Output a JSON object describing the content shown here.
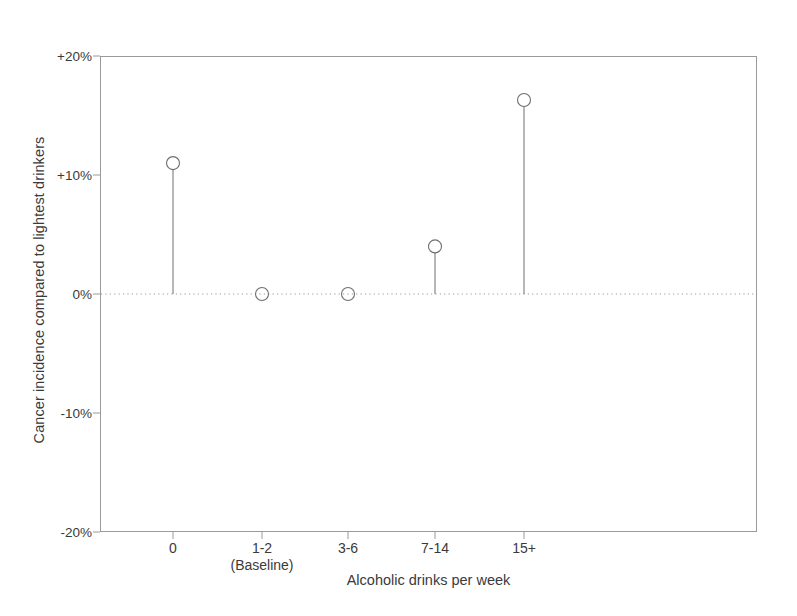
{
  "chart_data": {
    "type": "scatter",
    "title": "",
    "subtitle": "",
    "xlabel": "Alcoholic drinks per week",
    "ylabel": "Cancer incidence compared to lightest drinkers",
    "categories": [
      "0",
      "1-2\n(Baseline)",
      "3-6",
      "7-14",
      "15+"
    ],
    "category_labels": [
      "0",
      "1-2",
      "3-6",
      "7-14",
      "15+"
    ],
    "baseline_note": "(Baseline)",
    "values": [
      11,
      0,
      0,
      4,
      16.3
    ],
    "value_labels": [
      "+11%",
      "0%",
      "0%",
      "+4%",
      "+16.3%"
    ],
    "ylim": [
      -20,
      20
    ],
    "ytick_values": [
      20,
      10,
      0,
      -10,
      -20
    ],
    "ytick_labels": [
      "+20%",
      "+10%",
      "0%",
      "-10%",
      "-20%"
    ],
    "grid": false,
    "legend": "none",
    "reference_line": {
      "value": 0,
      "style": "dotted",
      "color": "#9a9a9a"
    },
    "marker": {
      "shape": "circle",
      "filled": false,
      "edge_color": "#6e6e6e",
      "radius_px": 6.5
    },
    "stem": {
      "color": "#6e6e6e",
      "width_px": 1
    },
    "frame_color": "#9a9a9a",
    "background": "#ffffff"
  },
  "axes": {
    "y_title": "Cancer incidence compared to lightest drinkers",
    "x_title": "Alcoholic drinks per week"
  }
}
